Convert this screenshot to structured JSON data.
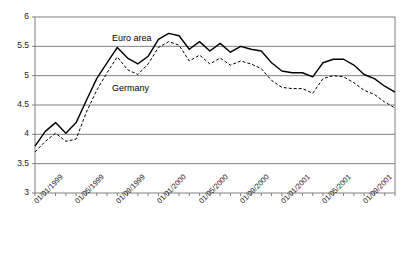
{
  "chart_data": {
    "type": "line",
    "title": "",
    "subtitle": "",
    "xlabel": "",
    "ylabel": "",
    "ylim": [
      3,
      6
    ],
    "yticks": [
      3,
      3.5,
      4,
      4.5,
      5,
      5.5,
      6
    ],
    "ytick_labels": [
      "3",
      "3.5",
      "4",
      "4.5",
      "5",
      "5.5",
      "6"
    ],
    "grid": "horizontal",
    "legend_position": "inline-annotation",
    "x_tick_labels": [
      "01/01/1999",
      "01/05/1999",
      "01/09/1999",
      "01/01/2000",
      "01/05/2000",
      "01/09/2000",
      "01/01/2001",
      "01/05/2001",
      "01/09/2001"
    ],
    "x_tick_indices": [
      0,
      4,
      8,
      12,
      16,
      20,
      24,
      28,
      32
    ],
    "x": [
      "01/1999",
      "02/1999",
      "03/1999",
      "04/1999",
      "05/1999",
      "06/1999",
      "07/1999",
      "08/1999",
      "09/1999",
      "10/1999",
      "11/1999",
      "12/1999",
      "01/2000",
      "02/2000",
      "03/2000",
      "04/2000",
      "05/2000",
      "06/2000",
      "07/2000",
      "08/2000",
      "09/2000",
      "10/2000",
      "11/2000",
      "12/2000",
      "01/2001",
      "02/2001",
      "03/2001",
      "04/2001",
      "05/2001",
      "06/2001",
      "07/2001",
      "08/2001",
      "09/2001",
      "10/2001",
      "11/2001",
      "12/2001"
    ],
    "series": [
      {
        "name": "Euro area",
        "style": "solid",
        "color": "#000000",
        "values": [
          3.8,
          4.05,
          4.2,
          4.02,
          4.2,
          4.58,
          4.95,
          5.22,
          5.48,
          5.3,
          5.2,
          5.33,
          5.62,
          5.72,
          5.68,
          5.45,
          5.58,
          5.42,
          5.55,
          5.4,
          5.5,
          5.45,
          5.42,
          5.22,
          5.08,
          5.05,
          5.05,
          4.98,
          5.22,
          5.28,
          5.28,
          5.18,
          5.02,
          4.95,
          4.82,
          4.72
        ]
      },
      {
        "name": "Germany",
        "style": "dashed",
        "color": "#000000",
        "values": [
          3.7,
          3.88,
          4.02,
          3.88,
          3.92,
          4.38,
          4.75,
          5.05,
          5.32,
          5.1,
          5.02,
          5.2,
          5.48,
          5.58,
          5.52,
          5.25,
          5.35,
          5.2,
          5.3,
          5.18,
          5.25,
          5.2,
          5.12,
          4.92,
          4.8,
          4.78,
          4.78,
          4.7,
          4.95,
          5.0,
          4.98,
          4.88,
          4.75,
          4.68,
          4.55,
          4.45
        ]
      }
    ],
    "annotations": [
      {
        "name": "euro-area-label",
        "text": "Euro area"
      },
      {
        "name": "germany-label",
        "text": "Germany"
      }
    ]
  },
  "axis": {
    "y_labels": [
      "6",
      "5.5",
      "5",
      "4.5",
      "4",
      "3.5",
      "3"
    ],
    "x_labels": [
      "01/01/1999",
      "01/05/1999",
      "01/09/1999",
      "01/01/2000",
      "01/05/2000",
      "01/09/2000",
      "01/01/2001",
      "01/05/2001",
      "01/09/2001"
    ]
  },
  "colors": {
    "axis": "#808080",
    "grid": "#808080",
    "line": "#000000",
    "background": "#ffffff"
  }
}
